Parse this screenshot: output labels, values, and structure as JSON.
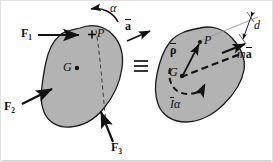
{
  "figure": {
    "name": "rigid-body-kinetics-equivalence-diagram",
    "equivalence_symbol": "≡",
    "colors": {
      "body_fill": "#b3b3b3",
      "body_stroke": "#1a1a1a",
      "label_color": "#111111",
      "background": "#ffffff",
      "frame": "#d8d8d8"
    }
  },
  "left_body": {
    "name": "free-body-diagram",
    "forces": [
      {
        "id": "F1",
        "label_main": "F",
        "label_sub": "1"
      },
      {
        "id": "F2",
        "label_main": "F",
        "label_sub": "2"
      },
      {
        "id": "F3",
        "label_main": "F",
        "label_sub": "3"
      }
    ],
    "angular_acceleration": "α",
    "point_P": "P",
    "point_P_marker": "+",
    "centroid_G": "G",
    "centroid_marker": "•"
  },
  "top_vector": {
    "name": "acceleration-vector-label",
    "symbol": "a"
  },
  "right_body": {
    "name": "kinetic-diagram",
    "point_P": "P",
    "centroid_G": "G",
    "position_vector": "ρ",
    "inertia_couple_I": "I",
    "inertia_couple_alpha": "α",
    "resultant_m": "m",
    "resultant_a": "a",
    "distance_label": "d"
  }
}
